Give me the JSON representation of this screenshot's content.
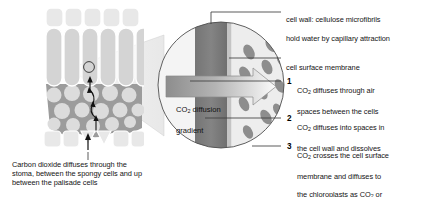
{
  "figure": {
    "colors": {
      "background": "#ffffff",
      "epidermis_fill": "#e3e3e3",
      "palisade_fill": "#d2d2d2",
      "spongy_fill": "#9a9a9a",
      "airspace_fill": "#dcdcdc",
      "cell_wall": "#7e7e7e",
      "membrane": "#c9c9c9",
      "cytoplasm": "#ededed",
      "chloroplast": "#8f8f8f",
      "cone_fill": "#efefef",
      "leader_line": "#4a4a4a",
      "text": "#141414"
    }
  },
  "leaf_caption": {
    "text": "Carbon dioxide diffuses through the stoma, between the spongy cells and up between the palisade cells"
  },
  "magnified_label": {
    "line1": "CO",
    "sub1": "2",
    "line1_rest": " diffusion",
    "line2": "gradient"
  },
  "callouts": [
    {
      "id": "cell-wall",
      "label_line1": "cell wall: cellulose microfibrils",
      "label_line2": "hold water by capillary attraction"
    },
    {
      "id": "cell-surface-membrane",
      "label_line1": "cell surface membrane",
      "label_line2": ""
    }
  ],
  "steps": [
    {
      "number": "1",
      "line1_pre": "CO",
      "line1_sub": "2",
      "line1_post": " diffuses through air",
      "line2": "spaces between the cells"
    },
    {
      "number": "2",
      "line1_pre": "CO",
      "line1_sub": "2",
      "line1_post": " diffuses into spaces in",
      "line2": "the cell wall and dissolves"
    },
    {
      "number": "3",
      "line1_pre": "CO",
      "line1_sub": "2",
      "line1_post": " crosses the cell surface",
      "line2": "membrane and diffuses to",
      "line3_pre": "the chloroplasts as CO",
      "line3_sub": "2",
      "line3_post": " or",
      "line4_a": "H",
      "line4_sub_a": "2",
      "line4_b": "CO",
      "line4_sub_b": "3",
      "line4_c": " or HCO",
      "line4_sub_c": "3",
      "line4_sup_c": "−"
    }
  ]
}
